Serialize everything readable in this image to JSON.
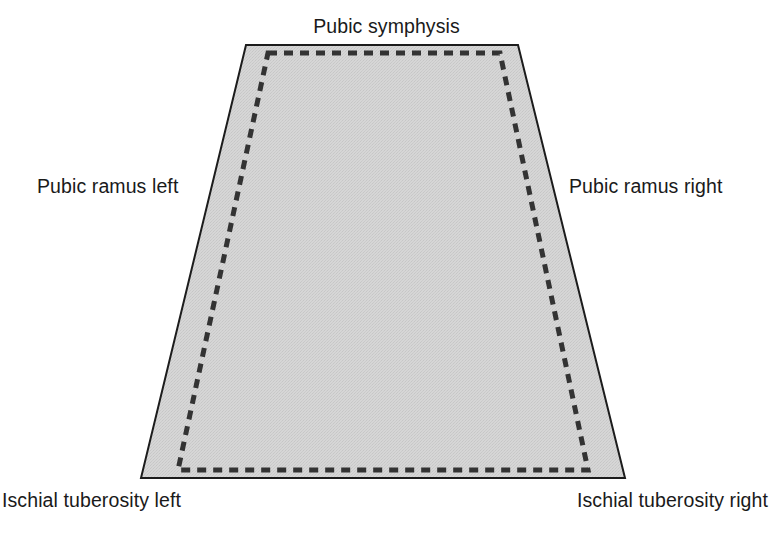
{
  "figure": {
    "background_color": "#ffffff",
    "shape": {
      "name": "pelvic-outlet-trapezoid",
      "fill_color": "#d2d2d2",
      "outline_color": "#1c1c1c",
      "outline_width": 2,
      "dashed_inner_color": "#333333",
      "dashed_inner_width": 5
    }
  },
  "labels": {
    "top": "Pubic symphysis",
    "left": "Pubic ramus left",
    "right": "Pubic ramus right",
    "bottom_left": "Ischial tuberosity left",
    "bottom_right": "Ischial tuberosity right"
  },
  "geometry": {
    "outer_points": "246,45 518,45 625,478 141,478",
    "inner_dashed_points": "268,53 500,53 588,470 178,470"
  }
}
